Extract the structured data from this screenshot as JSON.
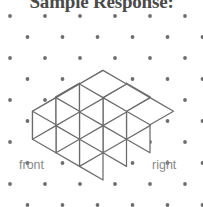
{
  "title": "Sample Response:",
  "labels": {
    "front": "front",
    "right": "right"
  },
  "colors": {
    "title": "#4a4a4a",
    "label": "#8a8a8a",
    "dot": "#6e6e6e",
    "edge": "#6b6b6b",
    "face": "#ffffff",
    "background": "#ffffff"
  },
  "figure": {
    "type": "isometric-cube-stack",
    "origin": {
      "x": 103.0,
      "y": 180.0
    },
    "unit": {
      "half_width": 23.5,
      "half_height": 13.6,
      "height": 28.0
    },
    "footprint": [
      [
        1,
        1,
        1
      ],
      [
        1,
        1,
        1
      ],
      [
        1,
        1,
        1
      ]
    ],
    "heights": [
      [
        2,
        2,
        1
      ],
      [
        2,
        1,
        1
      ],
      [
        1,
        1,
        1
      ]
    ],
    "cube_count": 12
  },
  "dotgrid": {
    "type": "triangular-lattice",
    "dx": 35.0,
    "dy": 21.0,
    "radius": 1.9,
    "x0": 10.0,
    "y0": 16.0,
    "cols": 7,
    "rows": 10
  }
}
